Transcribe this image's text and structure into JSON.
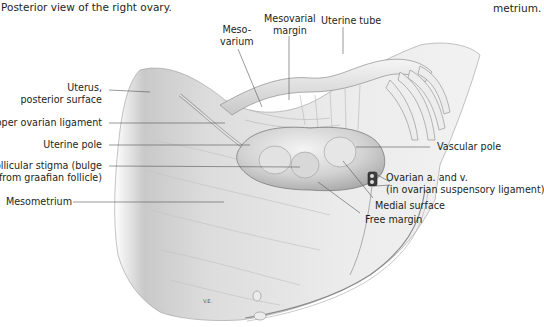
{
  "figure": {
    "caption_line": "Posterior view of the right ovary.",
    "caption_continuation": "metrium."
  },
  "labels": {
    "left": [
      {
        "id": "uterus-posterior-surface",
        "lines": [
          "Uterus,",
          "posterior surface"
        ]
      },
      {
        "id": "proper-ovarian-ligament",
        "lines": [
          "Proper ovarian ligament"
        ]
      },
      {
        "id": "uterine-pole",
        "lines": [
          "Uterine pole"
        ]
      },
      {
        "id": "follicular-stigma",
        "lines": [
          "Follicular stigma (bulge",
          "from graafian follicle)"
        ]
      },
      {
        "id": "mesometrium",
        "lines": [
          "Mesometrium"
        ]
      }
    ],
    "top": [
      {
        "id": "mesovarium",
        "lines": [
          "Meso-",
          "varium"
        ]
      },
      {
        "id": "mesovarial-margin",
        "lines": [
          "Mesovarial",
          "margin"
        ]
      },
      {
        "id": "uterine-tube",
        "lines": [
          "Uterine tube"
        ]
      }
    ],
    "right": [
      {
        "id": "vascular-pole",
        "lines": [
          "Vascular pole"
        ]
      },
      {
        "id": "ovarian-a-and-v",
        "lines": [
          "Ovarian a. and v.",
          "(in ovarian suspensory ligament)"
        ]
      },
      {
        "id": "medial-surface",
        "lines": [
          "Medial surface"
        ]
      },
      {
        "id": "free-margin",
        "lines": [
          "Free margin"
        ]
      }
    ]
  },
  "artist_signature": "V.E."
}
